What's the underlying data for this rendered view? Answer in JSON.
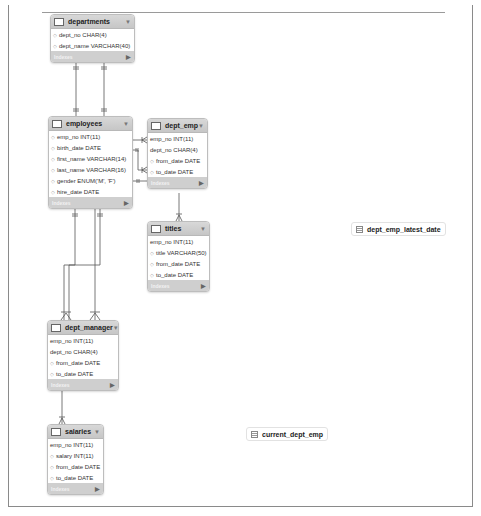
{
  "diagram": {
    "colors": {
      "header": "#cccccc",
      "footer": "#cfcfcf",
      "border": "#bdbdbd",
      "line": "#555555"
    },
    "tables": [
      {
        "name": "departments",
        "footer": "Indexes",
        "columns": [
          "dept_no CHAR(4)",
          "dept_name VARCHAR(40)"
        ]
      },
      {
        "name": "employees",
        "footer": "Indexes",
        "columns": [
          "emp_no INT(11)",
          "birth_date DATE",
          "first_name VARCHAR(14)",
          "last_name VARCHAR(16)",
          "gender ENUM('M', 'F')",
          "hire_date DATE"
        ]
      },
      {
        "name": "dept_emp",
        "footer": "Indexes",
        "columns": [
          "emp_no INT(11)",
          "dept_no CHAR(4)",
          "from_date DATE",
          "to_date DATE"
        ]
      },
      {
        "name": "titles",
        "footer": "Indexes",
        "columns": [
          "emp_no INT(11)",
          "title VARCHAR(50)",
          "from_date DATE",
          "to_date DATE"
        ]
      },
      {
        "name": "dept_manager",
        "footer": "Indexes",
        "columns": [
          "emp_no INT(11)",
          "dept_no CHAR(4)",
          "from_date DATE",
          "to_date DATE"
        ]
      },
      {
        "name": "salaries",
        "footer": "Indexes",
        "columns": [
          "emp_no INT(11)",
          "salary INT(11)",
          "from_date DATE",
          "to_date DATE"
        ]
      }
    ],
    "views": [
      {
        "name": "dept_emp_latest_date"
      },
      {
        "name": "current_dept_emp"
      }
    ],
    "icons": {
      "table": "table-icon",
      "view": "view-icon",
      "collapse": "▼",
      "expand": "▶",
      "key": "◇"
    }
  }
}
